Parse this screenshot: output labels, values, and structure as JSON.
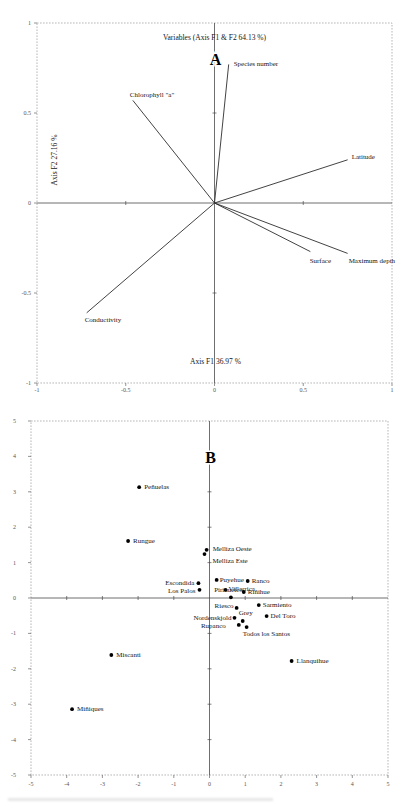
{
  "page": {
    "background": "#ffffff",
    "figure_type": "two-panel PCA figure"
  },
  "chart_data": [
    {
      "type": "scatter",
      "subtype": "pca-variable-loadings-biplot",
      "panel_letter": "A",
      "title": "Variables (Axis F1 & F2 64.13 %)",
      "xlabel": "Axis F1 36.97 %",
      "ylabel": "Axis F2 27.16 %",
      "xlim": [
        -1,
        1
      ],
      "ylim": [
        -1,
        1
      ],
      "xticks": [
        -1,
        -0.5,
        0,
        0.5,
        1
      ],
      "yticks": [
        -1,
        -0.5,
        0,
        0.5,
        1
      ],
      "grid": false,
      "legend": "none",
      "vectors": [
        {
          "label": "Species number",
          "x": 0.08,
          "y": 0.77,
          "anchor": "start",
          "dx": 5,
          "dy": 2
        },
        {
          "label": "Chlorophyll \"a\"",
          "x": -0.46,
          "y": 0.57,
          "anchor": "start",
          "dx": -3,
          "dy": -3
        },
        {
          "label": "Latitude",
          "x": 0.75,
          "y": 0.24,
          "anchor": "start",
          "dx": 4,
          "dy": -1
        },
        {
          "label": "Surface",
          "x": 0.54,
          "y": -0.27,
          "anchor": "middle",
          "dx": 10,
          "dy": 11
        },
        {
          "label": "Maximum depth",
          "x": 0.75,
          "y": -0.28,
          "anchor": "start",
          "dx": 1,
          "dy": 10
        },
        {
          "label": "Conductivity",
          "x": -0.72,
          "y": -0.61,
          "anchor": "start",
          "dx": -2,
          "dy": 9
        }
      ]
    },
    {
      "type": "scatter",
      "subtype": "pca-observation-scores",
      "panel_letter": "B",
      "title": "",
      "xlabel": "",
      "ylabel": "",
      "xlim": [
        -5,
        5
      ],
      "ylim": [
        -5,
        5
      ],
      "xticks": [
        -5,
        -4,
        -3,
        -2,
        -1,
        0,
        1,
        2,
        3,
        4,
        5
      ],
      "yticks": [
        -5,
        -4,
        -3,
        -2,
        -1,
        0,
        1,
        2,
        3,
        4,
        5
      ],
      "grid": false,
      "legend": "none",
      "points": [
        {
          "label": "Peñuelas",
          "x": -1.97,
          "y": 3.13,
          "anchor": "start",
          "dx": 5,
          "dy": 2
        },
        {
          "label": "Rungue",
          "x": -2.28,
          "y": 1.61,
          "anchor": "start",
          "dx": 5,
          "dy": 2
        },
        {
          "label": "Melliza Oeste",
          "x": -0.08,
          "y": 1.36,
          "anchor": "start",
          "dx": 6,
          "dy": 1
        },
        {
          "label": "Melliza Este",
          "x": -0.14,
          "y": 1.24,
          "anchor": "start",
          "dx": 8,
          "dy": 9
        },
        {
          "label": "Escondida",
          "x": -0.31,
          "y": 0.42,
          "anchor": "end",
          "dx": -4,
          "dy": 2
        },
        {
          "label": "Puyehue",
          "x": 0.2,
          "y": 0.51,
          "anchor": "start",
          "dx": 3,
          "dy": 2
        },
        {
          "label": "Ranco",
          "x": 1.07,
          "y": 0.48,
          "anchor": "start",
          "dx": 4,
          "dy": 2
        },
        {
          "label": "Villarrica",
          "x": 0.45,
          "y": 0.23,
          "anchor": "start",
          "dx": 3,
          "dy": 1
        },
        {
          "label": "Los Palos",
          "x": -0.28,
          "y": 0.23,
          "anchor": "end",
          "dx": -4,
          "dy": 3
        },
        {
          "label": "Pirihueico",
          "x": 0.6,
          "y": 0.02,
          "anchor": "end",
          "dx": 12,
          "dy": -5
        },
        {
          "label": "Riñihue",
          "x": 0.96,
          "y": 0.17,
          "anchor": "start",
          "dx": 4,
          "dy": 2
        },
        {
          "label": "Riesco",
          "x": 0.76,
          "y": -0.28,
          "anchor": "end",
          "dx": -3,
          "dy": 0
        },
        {
          "label": "Sarmiento",
          "x": 1.38,
          "y": -0.2,
          "anchor": "start",
          "dx": 4,
          "dy": 2
        },
        {
          "label": "Del Toro",
          "x": 1.6,
          "y": -0.51,
          "anchor": "start",
          "dx": 4,
          "dy": 2
        },
        {
          "label": "Nordenskjold",
          "x": 0.7,
          "y": -0.56,
          "anchor": "end",
          "dx": -3,
          "dy": 2
        },
        {
          "label": "Grey",
          "x": 0.93,
          "y": -0.65,
          "anchor": "middle",
          "dx": 3,
          "dy": -6
        },
        {
          "label": "Rupanco",
          "x": 0.82,
          "y": -0.76,
          "anchor": "end",
          "dx": -13,
          "dy": 3
        },
        {
          "label": "Todos los Santos",
          "x": 1.04,
          "y": -0.82,
          "anchor": "start",
          "dx": -4,
          "dy": 9
        },
        {
          "label": "Miscanti",
          "x": -2.75,
          "y": -1.61,
          "anchor": "start",
          "dx": 5,
          "dy": 2
        },
        {
          "label": "Llanquihue",
          "x": 2.3,
          "y": -1.78,
          "anchor": "start",
          "dx": 5,
          "dy": 2
        },
        {
          "label": "Miñiques",
          "x": -3.85,
          "y": -3.14,
          "anchor": "start",
          "dx": 5,
          "dy": 2
        }
      ]
    }
  ]
}
